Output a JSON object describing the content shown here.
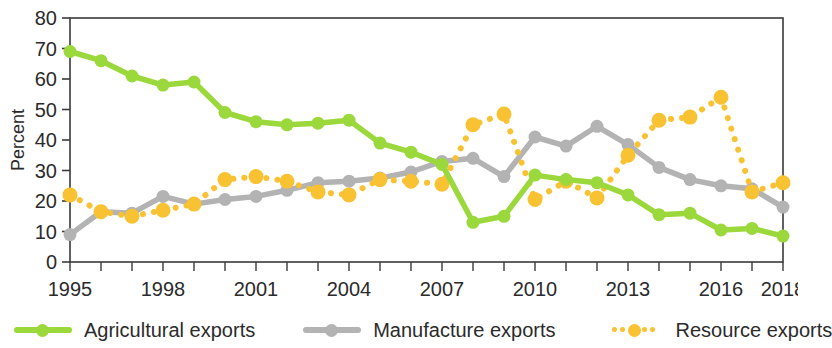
{
  "chart_data": {
    "type": "line",
    "title": "",
    "xlabel": "",
    "ylabel": "Percent",
    "ylim": [
      0,
      80
    ],
    "ytick_step": 10,
    "grid": false,
    "legend_position": "bottom",
    "x": [
      1995,
      1996,
      1997,
      1998,
      1999,
      2000,
      2001,
      2002,
      2003,
      2004,
      2005,
      2006,
      2007,
      2008,
      2009,
      2010,
      2011,
      2012,
      2013,
      2014,
      2015,
      2016,
      2017,
      2018
    ],
    "x_tick_labels": [
      "1995",
      "1998",
      "2001",
      "2004",
      "2007",
      "2010",
      "2013",
      "2016",
      "2018"
    ],
    "x_tick_values": [
      1995,
      1998,
      2001,
      2004,
      2007,
      2010,
      2013,
      2016,
      2018
    ],
    "y_tick_labels": [
      "0",
      "10",
      "20",
      "30",
      "40",
      "50",
      "60",
      "70",
      "80"
    ],
    "series": [
      {
        "name": "Agricultural exports",
        "color": "#9bd83c",
        "style": "solid",
        "values": [
          69,
          66,
          61,
          58,
          59,
          49,
          46,
          45,
          45.5,
          46.5,
          39,
          36,
          32,
          13,
          15,
          28.5,
          27,
          26,
          22,
          15.5,
          16,
          10.5,
          11,
          8.5
        ]
      },
      {
        "name": "Manufacture exports",
        "color": "#b3b3b3",
        "style": "solid",
        "values": [
          9,
          16.5,
          16,
          21.5,
          19,
          20.5,
          21.5,
          23.5,
          26,
          26.5,
          27.5,
          29.5,
          33,
          34,
          28,
          41,
          38,
          44.5,
          38.5,
          31,
          27,
          25,
          24,
          18
        ]
      },
      {
        "name": "Resource exports",
        "color": "#f9c233",
        "style": "dotted",
        "values": [
          22,
          16.5,
          15,
          17,
          19,
          27,
          28,
          26.5,
          23,
          22,
          27,
          26.5,
          25.5,
          45,
          48.5,
          20.5,
          26.5,
          21,
          35,
          46.5,
          47.5,
          54,
          23,
          26
        ]
      }
    ]
  },
  "legend": {
    "items": [
      {
        "label": "Agricultural exports",
        "color": "#9bd83c",
        "style": "solid"
      },
      {
        "label": "Manufacture exports",
        "color": "#b3b3b3",
        "style": "solid"
      },
      {
        "label": "Resource exports",
        "color": "#f9c233",
        "style": "dotted"
      }
    ]
  },
  "axis": {
    "y_title": "Percent"
  }
}
